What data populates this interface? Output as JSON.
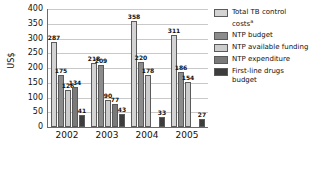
{
  "chart_data": {
    "type": "bar",
    "title": "",
    "xlabel": "",
    "ylabel": "US$",
    "ylim": [
      0,
      400
    ],
    "yticks": [
      400,
      350,
      300,
      250,
      200,
      150,
      100,
      50,
      0
    ],
    "grid": true,
    "legend_position": "right",
    "categories": [
      "2002",
      "2003",
      "2004",
      "2005"
    ],
    "series": [
      {
        "name": "Total TB control costs",
        "name_suffix": "a",
        "color": "#d3d3d3",
        "values": [
          287,
          218,
          358,
          311
        ],
        "labels": [
          "287",
          "218",
          "358",
          "311"
        ]
      },
      {
        "name": "NTP budget",
        "color": "#8c8c8c",
        "values": [
          175,
          209,
          220,
          186
        ],
        "labels": [
          "175",
          "209",
          "220",
          "186"
        ]
      },
      {
        "name": "NTP available funding",
        "color": "#cccccc",
        "values": [
          126,
          90,
          178,
          154
        ],
        "labels": [
          "126",
          "90",
          "178",
          "154"
        ]
      },
      {
        "name": "NTP expenditure",
        "color": "#7a7a7a",
        "values": [
          134,
          77,
          null,
          null
        ],
        "labels": [
          "134",
          "77",
          "",
          ""
        ]
      },
      {
        "name": "First-line drugs budget",
        "color": "#3d3d3d",
        "values": [
          41,
          43,
          33,
          27
        ],
        "labels": [
          "41",
          "43",
          "33",
          "27"
        ]
      }
    ]
  },
  "legend": {
    "items": [
      {
        "label": "Total TB control costs",
        "sup": "a"
      },
      {
        "label": "NTP budget",
        "sup": ""
      },
      {
        "label": "NTP available funding",
        "sup": ""
      },
      {
        "label": "NTP expenditure",
        "sup": ""
      },
      {
        "label": "First-line drugs budget",
        "sup": ""
      }
    ]
  }
}
